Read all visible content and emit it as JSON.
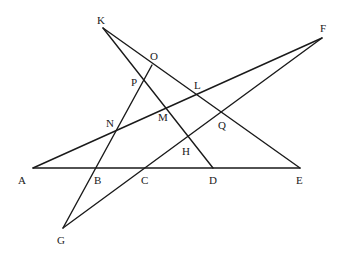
{
  "diagram": {
    "type": "geometry-figure",
    "line_color": "#1a1a1a",
    "background": "#ffffff",
    "points": {
      "K": {
        "label": "K",
        "x": 103,
        "y": 28,
        "lx": 97,
        "ly": 24
      },
      "O": {
        "label": "O",
        "x": 152,
        "y": 65,
        "lx": 150,
        "ly": 60
      },
      "F": {
        "label": "F",
        "x": 322,
        "y": 38,
        "lx": 320,
        "ly": 32
      },
      "P": {
        "label": "P",
        "x": 144,
        "y": 80,
        "lx": 131,
        "ly": 86
      },
      "L": {
        "label": "L",
        "x": 196,
        "y": 94,
        "lx": 194,
        "ly": 89
      },
      "N": {
        "label": "N",
        "x": 118,
        "y": 125,
        "lx": 106,
        "ly": 127
      },
      "M": {
        "label": "M",
        "x": 167,
        "y": 105,
        "lx": 158,
        "ly": 121
      },
      "Q": {
        "label": "Q",
        "x": 222,
        "y": 112,
        "lx": 218,
        "ly": 129
      },
      "H": {
        "label": "H",
        "x": 188,
        "y": 143,
        "lx": 182,
        "ly": 155
      },
      "A": {
        "label": "A",
        "x": 33,
        "y": 168,
        "lx": 18,
        "ly": 184
      },
      "B": {
        "label": "B",
        "x": 96,
        "y": 168,
        "lx": 94,
        "ly": 184
      },
      "C": {
        "label": "C",
        "x": 144,
        "y": 168,
        "lx": 141,
        "ly": 184
      },
      "D": {
        "label": "D",
        "x": 213,
        "y": 168,
        "lx": 209,
        "ly": 184
      },
      "E": {
        "label": "E",
        "x": 300,
        "y": 168,
        "lx": 296,
        "ly": 184
      },
      "G": {
        "label": "G",
        "x": 63,
        "y": 228,
        "lx": 57,
        "ly": 244
      }
    },
    "segments": [
      {
        "name": "segment-A-E",
        "from": "A",
        "to": "E"
      },
      {
        "name": "segment-A-F",
        "from": "A",
        "to": "F"
      },
      {
        "name": "segment-K-E",
        "from": "K",
        "to": "E"
      },
      {
        "name": "segment-K-D",
        "from": "K",
        "to": "D"
      },
      {
        "name": "segment-G-O",
        "from": "G",
        "to": "O"
      },
      {
        "name": "segment-G-F",
        "from": "G",
        "to": "F"
      }
    ]
  }
}
